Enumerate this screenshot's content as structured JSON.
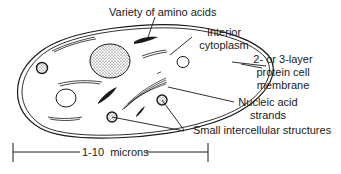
{
  "diagram": {
    "labels": {
      "amino_acids": "Variety of amino acids",
      "cytoplasm_line1": "Interior",
      "cytoplasm_line2": "cytoplasm",
      "membrane_line1": "2- or 3-layer",
      "membrane_line2": "protein cell",
      "membrane_line3": "membrane",
      "nucleic_line1": "Nucleic acid",
      "nucleic_line2": "strands",
      "small_structures": "Small intercellular structures",
      "scale": "1-10  microns"
    },
    "colors": {
      "ink": "#1a1a1a",
      "background": "#ffffff"
    }
  }
}
